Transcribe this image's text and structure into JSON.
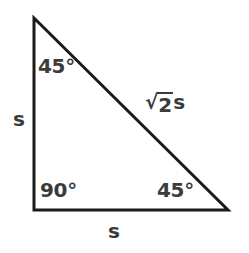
{
  "figure": {
    "background_color": "#ffffff",
    "stroke_color": "#1a1a1a",
    "text_color": "#3b3b3b",
    "stroke_width": 3,
    "vertices": {
      "top_left": [
        34,
        18
      ],
      "bottom_left": [
        34,
        210
      ],
      "bottom_right": [
        228,
        210
      ]
    }
  },
  "labels": {
    "angle_top": "45°",
    "angle_bottom_left": "90°",
    "angle_bottom_right": "45°",
    "side_left": "s",
    "side_bottom": "s",
    "side_hypotenuse_radical": "√",
    "side_hypotenuse_radicand": "2",
    "side_hypotenuse_suffix": "s",
    "side_hypotenuse_full": "√2s"
  }
}
